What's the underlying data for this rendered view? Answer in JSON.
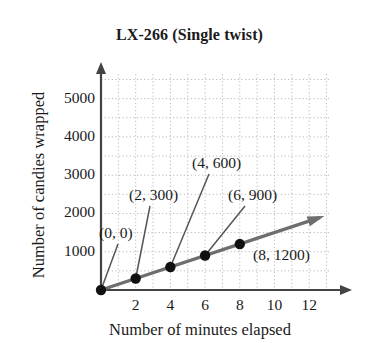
{
  "chart_data": {
    "type": "line",
    "title": "LX-266 (Single twist)",
    "xlabel": "Number of minutes elapsed",
    "ylabel": "Number of candies wrapped",
    "xlim": [
      0,
      13.2
    ],
    "ylim": [
      0,
      5800
    ],
    "grid": true,
    "legend": "none",
    "x_ticks": [
      "2",
      "4",
      "6",
      "8",
      "10",
      "12"
    ],
    "x_tick_values": [
      2,
      4,
      6,
      8,
      10,
      12
    ],
    "y_ticks": [
      "1000",
      "2000",
      "3000",
      "4000",
      "5000"
    ],
    "y_tick_values": [
      1000,
      2000,
      3000,
      4000,
      5000
    ],
    "series": [
      {
        "name": "LX-266 (Single twist)",
        "x": [
          0,
          2,
          4,
          6,
          8
        ],
        "values": [
          0,
          300,
          600,
          900,
          1200
        ],
        "color": "#6e6e6e",
        "marker_color": "#111111"
      }
    ],
    "annotations": [
      {
        "label": "(0, 0)",
        "x": 0,
        "y": 0
      },
      {
        "label": "(2, 300)",
        "x": 2,
        "y": 300
      },
      {
        "label": "(4, 600)",
        "x": 4,
        "y": 600
      },
      {
        "label": "(6, 900)",
        "x": 6,
        "y": 900
      },
      {
        "label": "(8, 1200)",
        "x": 8,
        "y": 1200
      }
    ]
  },
  "colors": {
    "axis": "#444444",
    "grid": "#b9b9b9",
    "trend_line": "#6e6e6e",
    "marker": "#111111",
    "leader": "#555555",
    "background": "#ffffff",
    "text": "#1a1a1a"
  }
}
